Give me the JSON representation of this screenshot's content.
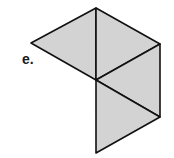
{
  "label": "e.",
  "colors": {
    "fill": "#d3d3d3",
    "stroke": "#111111",
    "background": "#ffffff"
  },
  "vertices": {
    "top": [
      96,
      8
    ],
    "left": [
      31,
      43
    ],
    "right_upper": [
      160,
      44
    ],
    "center": [
      96,
      80
    ],
    "right_lower": [
      160,
      117
    ],
    "bottom": [
      96,
      153
    ]
  },
  "triangles": [
    {
      "name": "left-upper",
      "points": [
        "top",
        "left",
        "center"
      ]
    },
    {
      "name": "right-upper",
      "points": [
        "top",
        "right_upper",
        "center"
      ]
    },
    {
      "name": "right-middle",
      "points": [
        "center",
        "right_upper",
        "right_lower"
      ]
    },
    {
      "name": "lower",
      "points": [
        "center",
        "right_lower",
        "bottom"
      ]
    }
  ]
}
